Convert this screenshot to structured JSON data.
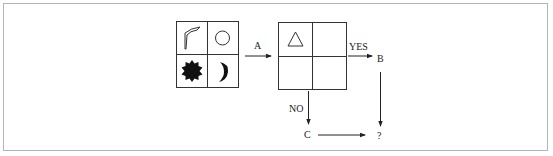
{
  "diagram": {
    "type": "flowchart-puzzle",
    "colors": {
      "stroke": "#333333",
      "fill_dark": "#111111",
      "frame_border": "#b5b5b5",
      "background": "#ffffff"
    },
    "source_grid": {
      "cells": [
        {
          "position": "top-left",
          "shape": "curved-corner-arrow",
          "style": "outline"
        },
        {
          "position": "top-right",
          "shape": "circle",
          "style": "outline"
        },
        {
          "position": "bottom-left",
          "shape": "star-burst",
          "style": "filled"
        },
        {
          "position": "bottom-right",
          "shape": "crescent",
          "style": "filled"
        }
      ]
    },
    "target_grid": {
      "cells": [
        {
          "position": "top-left",
          "shape": "triangle",
          "style": "outline"
        },
        {
          "position": "top-right",
          "shape": "empty",
          "style": "none"
        },
        {
          "position": "bottom-left",
          "shape": "empty",
          "style": "none"
        },
        {
          "position": "bottom-right",
          "shape": "empty",
          "style": "none"
        }
      ]
    },
    "labels": {
      "arrow_a": "A",
      "yes": "YES",
      "node_b": "B",
      "no": "NO",
      "node_c": "C",
      "result": "?"
    },
    "edges": [
      {
        "from": "source_grid",
        "to": "target_grid",
        "label": "A"
      },
      {
        "from": "target_grid",
        "to": "B",
        "label": "YES"
      },
      {
        "from": "target_grid",
        "to": "C",
        "label": "NO"
      },
      {
        "from": "B",
        "to": "?",
        "label": ""
      },
      {
        "from": "C",
        "to": "?",
        "label": ""
      }
    ]
  }
}
